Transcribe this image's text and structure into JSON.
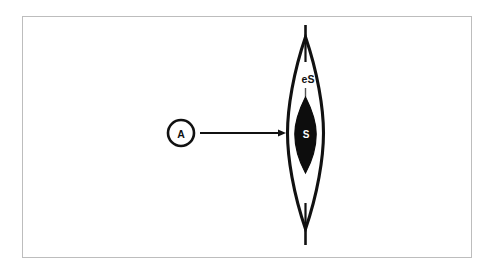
{
  "figure": {
    "background_color": "#ffffff",
    "frame_color": "#bdbdbd",
    "ink_color": "#111111",
    "labels": {
      "source_label": "A",
      "outer_region_label": "eS",
      "inner_region_label": "S"
    },
    "elements": {
      "source_marker_name": "circle marker A",
      "arrow_name": "arrow from A to lens",
      "outer_lens_name": "outer lens eS",
      "inner_lens_name": "inner filled lens S",
      "axis_line_name": "vertical axis line"
    }
  },
  "geometry": {
    "frame": {
      "x": 22,
      "y": 16,
      "width": 450,
      "height": 242
    },
    "source_circle": {
      "cx": 181,
      "cy": 133,
      "r": 13
    },
    "arrow": {
      "x1": 200,
      "y1": 133,
      "x2": 285,
      "y2": 133
    },
    "axis_line": {
      "x": 305.5,
      "y_top": 25,
      "y_bottom": 245
    },
    "outer_lens": {
      "cx": 305.5,
      "cy": 133,
      "half_width": 18,
      "y_top": 37,
      "y_bottom": 229
    },
    "inner_lens": {
      "cx": 305.5,
      "cy": 134,
      "half_width": 11,
      "y_top": 97,
      "y_bottom": 173
    },
    "inner_tick_top": {
      "x": 305.5,
      "y1": 40,
      "y2": 62
    },
    "inner_tick_bottom": {
      "x": 305.5,
      "y1": 203,
      "y2": 226
    },
    "faint_tick": {
      "x": 305.5,
      "y1": 88,
      "y2": 97
    },
    "label_positions": {
      "source_label": {
        "x": 181,
        "y": 137
      },
      "outer_region_label": {
        "x": 308,
        "y": 83
      },
      "inner_region_label": {
        "x": 306,
        "y": 138
      }
    }
  }
}
